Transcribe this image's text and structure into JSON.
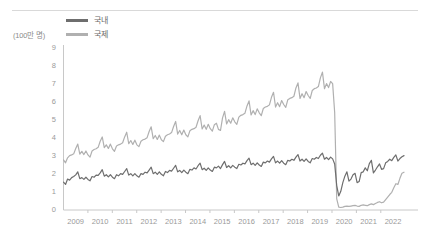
{
  "chart_data": {
    "type": "line",
    "title": "",
    "subtitle": "",
    "unit_label": "(100만 명)",
    "xlabel": "",
    "ylabel": "",
    "ylim": [
      0,
      9
    ],
    "y_ticks": [
      0,
      1,
      2,
      3,
      4,
      5,
      6,
      7,
      8,
      9
    ],
    "x_tick_labels": [
      "2009",
      "2010",
      "2011",
      "2012",
      "2013",
      "2014",
      "2015",
      "2016",
      "2017",
      "2018",
      "2019",
      "2020",
      "2021",
      "2022"
    ],
    "x_range": [
      2009.0,
      2022.95
    ],
    "grid": false,
    "legend_position": "top-left",
    "colors": {
      "domestic": "#6e6e6e",
      "international": "#b0b0b0",
      "axis": "#c8c8c8",
      "tick_text": "#9a9a9a",
      "legend_text": "#6a6a6a",
      "rule": "#d9d9d9",
      "background": "#ffffff"
    },
    "series": [
      {
        "name": "국내",
        "color": "#6e6e6e",
        "values": [
          1.55,
          1.42,
          1.72,
          1.66,
          1.8,
          1.86,
          1.95,
          2.12,
          1.74,
          1.8,
          1.7,
          1.82,
          1.7,
          1.62,
          1.86,
          1.82,
          1.94,
          1.92,
          2.06,
          2.24,
          1.88,
          1.96,
          1.84,
          1.96,
          1.82,
          1.74,
          1.96,
          1.9,
          2.02,
          1.98,
          2.14,
          2.3,
          1.94,
          2.02,
          1.9,
          2.02,
          1.9,
          1.82,
          2.02,
          1.98,
          2.1,
          2.06,
          2.22,
          2.38,
          2.02,
          2.1,
          1.98,
          2.12,
          1.98,
          1.9,
          2.14,
          2.08,
          2.2,
          2.16,
          2.32,
          2.48,
          2.12,
          2.2,
          2.08,
          2.22,
          2.1,
          2.02,
          2.26,
          2.22,
          2.34,
          2.28,
          2.46,
          2.6,
          2.24,
          2.32,
          2.2,
          2.34,
          2.22,
          2.14,
          2.38,
          2.34,
          2.44,
          2.3,
          2.52,
          2.7,
          2.36,
          2.46,
          2.34,
          2.48,
          2.38,
          2.3,
          2.54,
          2.5,
          2.6,
          2.56,
          2.74,
          2.88,
          2.52,
          2.6,
          2.48,
          2.62,
          2.5,
          2.42,
          2.66,
          2.62,
          2.72,
          2.66,
          2.84,
          2.98,
          2.62,
          2.72,
          2.6,
          2.74,
          2.6,
          2.52,
          2.76,
          2.72,
          2.82,
          2.76,
          2.94,
          3.08,
          2.72,
          2.82,
          2.7,
          2.84,
          2.7,
          2.62,
          2.86,
          2.82,
          2.92,
          2.86,
          3.04,
          3.16,
          2.82,
          2.92,
          2.8,
          2.94,
          2.84,
          2.56,
          1.36,
          0.78,
          1.04,
          1.52,
          1.88,
          2.12,
          1.6,
          1.72,
          1.96,
          2.04,
          1.52,
          1.58,
          2.08,
          2.12,
          2.34,
          2.18,
          2.58,
          2.76,
          2.06,
          2.22,
          2.4,
          2.56,
          2.26,
          2.3,
          2.62,
          2.7,
          2.82,
          2.74,
          2.92,
          3.06,
          2.72,
          2.86,
          2.96,
          3.02
        ]
      },
      {
        "name": "국제",
        "color": "#b0b0b0",
        "values": [
          2.78,
          2.62,
          2.9,
          3.02,
          3.06,
          3.12,
          3.42,
          3.66,
          3.1,
          3.26,
          3.08,
          3.28,
          3.06,
          2.94,
          3.28,
          3.36,
          3.4,
          3.48,
          3.82,
          4.06,
          3.46,
          3.62,
          3.42,
          3.66,
          3.4,
          3.26,
          3.56,
          3.62,
          3.66,
          3.74,
          4.06,
          4.32,
          3.68,
          3.86,
          3.64,
          3.88,
          3.62,
          3.52,
          3.82,
          3.9,
          3.94,
          4.02,
          4.36,
          4.62,
          3.96,
          4.14,
          3.92,
          4.16,
          3.9,
          3.8,
          4.1,
          4.18,
          4.22,
          4.3,
          4.64,
          4.92,
          4.22,
          4.42,
          4.18,
          4.44,
          4.18,
          4.06,
          4.4,
          4.48,
          4.52,
          4.6,
          4.96,
          5.24,
          4.5,
          4.72,
          4.48,
          4.76,
          4.52,
          4.38,
          4.74,
          4.82,
          4.48,
          4.42,
          5.12,
          5.48,
          4.78,
          5.02,
          4.82,
          5.12,
          4.9,
          4.76,
          5.16,
          5.26,
          5.3,
          5.38,
          5.78,
          6.06,
          5.28,
          5.52,
          5.3,
          5.62,
          5.4,
          5.24,
          5.64,
          5.72,
          5.76,
          5.84,
          6.26,
          6.54,
          5.72,
          5.96,
          5.74,
          6.08,
          5.86,
          5.7,
          6.12,
          6.2,
          6.24,
          6.32,
          6.78,
          7.06,
          6.2,
          6.46,
          6.24,
          6.58,
          6.36,
          6.2,
          6.64,
          6.74,
          6.78,
          6.86,
          7.34,
          7.66,
          6.74,
          7.02,
          6.8,
          7.14,
          7.02,
          5.42,
          0.62,
          0.16,
          0.14,
          0.16,
          0.2,
          0.22,
          0.2,
          0.22,
          0.24,
          0.26,
          0.22,
          0.2,
          0.26,
          0.28,
          0.26,
          0.24,
          0.3,
          0.34,
          0.3,
          0.36,
          0.42,
          0.46,
          0.4,
          0.44,
          0.58,
          0.72,
          0.86,
          0.98,
          1.24,
          1.46,
          1.42,
          1.76,
          2.04,
          2.1
        ]
      }
    ]
  }
}
